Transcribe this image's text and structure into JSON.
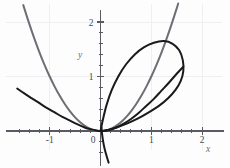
{
  "chart_data": {
    "type": "line",
    "title": "",
    "xlabel": "x",
    "ylabel": "y",
    "xlim": [
      -1.62,
      2.1
    ],
    "ylim": [
      -0.6,
      2.25
    ],
    "xticks": [
      -1,
      0,
      1,
      2
    ],
    "xtick_labels": [
      "-1",
      "0",
      "1",
      "2"
    ],
    "yticks": [
      0,
      1,
      2
    ],
    "ytick_labels": [
      "0",
      "1",
      "2"
    ],
    "minor_tick_step": 0.2,
    "grid": true,
    "grid_color": "#efeff2",
    "axis_color": "#5a5a62",
    "background": "#fdfdfd",
    "legend": "none",
    "series": [
      {
        "name": "gray-parabola",
        "color": "#6e6e76",
        "width": 2.0,
        "description": "upward parabola y = x^2, vertex at origin",
        "points": [
          [
            -1.52,
            2.31
          ],
          [
            -1.4,
            1.96
          ],
          [
            -1.3,
            1.69
          ],
          [
            -1.2,
            1.44
          ],
          [
            -1.1,
            1.21
          ],
          [
            -1.0,
            1.0
          ],
          [
            -0.9,
            0.81
          ],
          [
            -0.8,
            0.64
          ],
          [
            -0.7,
            0.49
          ],
          [
            -0.6,
            0.36
          ],
          [
            -0.5,
            0.25
          ],
          [
            -0.4,
            0.16
          ],
          [
            -0.3,
            0.09
          ],
          [
            -0.2,
            0.04
          ],
          [
            -0.1,
            0.01
          ],
          [
            0.0,
            0.0
          ],
          [
            0.1,
            0.01
          ],
          [
            0.2,
            0.04
          ],
          [
            0.3,
            0.09
          ],
          [
            0.4,
            0.16
          ],
          [
            0.5,
            0.25
          ],
          [
            0.6,
            0.36
          ],
          [
            0.7,
            0.49
          ],
          [
            0.8,
            0.64
          ],
          [
            0.9,
            0.81
          ],
          [
            1.0,
            1.0
          ],
          [
            1.1,
            1.21
          ],
          [
            1.2,
            1.44
          ],
          [
            1.3,
            1.69
          ],
          [
            1.4,
            1.96
          ],
          [
            1.5,
            2.25
          ],
          [
            1.53,
            2.34
          ]
        ]
      },
      {
        "name": "black-flat-curve",
        "color": "#1a1a1a",
        "width": 2.0,
        "description": "flatter upward curve from upper-left through origin",
        "points": [
          [
            -1.64,
            0.78
          ],
          [
            -1.5,
            0.69
          ],
          [
            -1.35,
            0.6
          ],
          [
            -1.2,
            0.51
          ],
          [
            -1.05,
            0.42
          ],
          [
            -0.9,
            0.34
          ],
          [
            -0.75,
            0.26
          ],
          [
            -0.6,
            0.19
          ],
          [
            -0.45,
            0.12
          ],
          [
            -0.3,
            0.06
          ],
          [
            -0.18,
            0.03
          ],
          [
            -0.08,
            0.01
          ],
          [
            0.0,
            0.0
          ],
          [
            0.15,
            0.02
          ],
          [
            0.3,
            0.06
          ],
          [
            0.45,
            0.13
          ],
          [
            0.6,
            0.22
          ],
          [
            0.75,
            0.33
          ],
          [
            0.9,
            0.46
          ],
          [
            1.05,
            0.59
          ],
          [
            1.2,
            0.74
          ],
          [
            1.35,
            0.89
          ],
          [
            1.5,
            1.05
          ],
          [
            1.63,
            1.18
          ]
        ]
      },
      {
        "name": "black-loop-curve",
        "color": "#1a1a1a",
        "width": 2.0,
        "description": "closed loop from origin, peak near (1.27, 1.65), rightmost near (1.63, 1.00), returning to origin",
        "points": [
          [
            0.0,
            0.0
          ],
          [
            0.05,
            0.22
          ],
          [
            0.12,
            0.48
          ],
          [
            0.22,
            0.75
          ],
          [
            0.35,
            1.0
          ],
          [
            0.5,
            1.22
          ],
          [
            0.68,
            1.41
          ],
          [
            0.86,
            1.54
          ],
          [
            1.05,
            1.62
          ],
          [
            1.25,
            1.65
          ],
          [
            1.42,
            1.6
          ],
          [
            1.55,
            1.48
          ],
          [
            1.62,
            1.3
          ],
          [
            1.63,
            1.1
          ],
          [
            1.58,
            0.92
          ],
          [
            1.48,
            0.76
          ],
          [
            1.33,
            0.6
          ],
          [
            1.15,
            0.46
          ],
          [
            0.95,
            0.34
          ],
          [
            0.74,
            0.23
          ],
          [
            0.53,
            0.14
          ],
          [
            0.33,
            0.07
          ],
          [
            0.16,
            0.02
          ],
          [
            0.05,
            0.0
          ],
          [
            0.0,
            0.0
          ]
        ]
      },
      {
        "name": "black-loop-tail",
        "color": "#1a1a1a",
        "width": 2.0,
        "description": "branch descending below the x-axis just right of the origin",
        "points": [
          [
            0.02,
            0.06
          ],
          [
            0.03,
            -0.05
          ],
          [
            0.05,
            -0.18
          ],
          [
            0.08,
            -0.32
          ],
          [
            0.12,
            -0.46
          ],
          [
            0.16,
            -0.58
          ]
        ]
      }
    ]
  },
  "axes": {
    "x_label": "x",
    "y_label": "y",
    "x_tick_labels": [
      "-1",
      "0",
      "1",
      "2"
    ],
    "y_tick_labels": [
      "2",
      "1"
    ],
    "origin_label": "0"
  }
}
